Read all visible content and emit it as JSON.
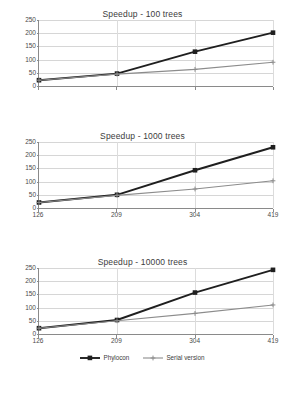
{
  "chart_data": [
    {
      "type": "line",
      "title": "Speedup - 100 trees",
      "xlabel": "",
      "ylabel": "",
      "categories": [
        "126",
        "209",
        "304",
        "419"
      ],
      "ylim": [
        0,
        250
      ],
      "yticks": [
        "0",
        "50",
        "100",
        "150",
        "200",
        "250"
      ],
      "grid": true,
      "legend_position": "bottom-shared",
      "show_xticks": false,
      "series": [
        {
          "name": "Phylocon",
          "values": [
            22,
            47,
            130,
            202
          ],
          "color": "#1f1f1f",
          "marker": "square"
        },
        {
          "name": "Serial version",
          "values": [
            22,
            45,
            63,
            90
          ],
          "color": "#8c8c8c",
          "marker": "plus"
        }
      ]
    },
    {
      "type": "line",
      "title": "Speedup - 1000 trees",
      "xlabel": "",
      "ylabel": "",
      "categories": [
        "126",
        "209",
        "304",
        "419"
      ],
      "ylim": [
        0,
        250
      ],
      "yticks": [
        "0",
        "50",
        "100",
        "150",
        "200",
        "250"
      ],
      "grid": true,
      "legend_position": "bottom-shared",
      "show_xticks": true,
      "series": [
        {
          "name": "Phylocon",
          "values": [
            21,
            50,
            143,
            230
          ],
          "color": "#1f1f1f",
          "marker": "square"
        },
        {
          "name": "Serial version",
          "values": [
            21,
            48,
            72,
            103
          ],
          "color": "#8c8c8c",
          "marker": "plus"
        }
      ]
    },
    {
      "type": "line",
      "title": "Speedup - 10000 trees",
      "xlabel": "",
      "ylabel": "",
      "categories": [
        "126",
        "209",
        "304",
        "419"
      ],
      "ylim": [
        0,
        250
      ],
      "yticks": [
        "0",
        "50",
        "100",
        "150",
        "200",
        "250"
      ],
      "grid": true,
      "legend_position": "bottom-shared",
      "show_xticks": true,
      "series": [
        {
          "name": "Phylocon",
          "values": [
            22,
            53,
            157,
            243
          ],
          "color": "#1f1f1f",
          "marker": "square"
        },
        {
          "name": "Serial version",
          "values": [
            22,
            50,
            78,
            110
          ],
          "color": "#8c8c8c",
          "marker": "plus"
        }
      ]
    }
  ],
  "legend": {
    "items": [
      {
        "label": "Phylocon",
        "color": "#1f1f1f"
      },
      {
        "label": "Serial version",
        "color": "#8c8c8c"
      }
    ]
  },
  "colors": {
    "series_primary": "#1f1f1f",
    "series_secondary": "#8c8c8c",
    "grid": "#d6d6d6",
    "axis": "#8a8a8a",
    "text": "#3c3c3c",
    "background": "#ffffff"
  }
}
